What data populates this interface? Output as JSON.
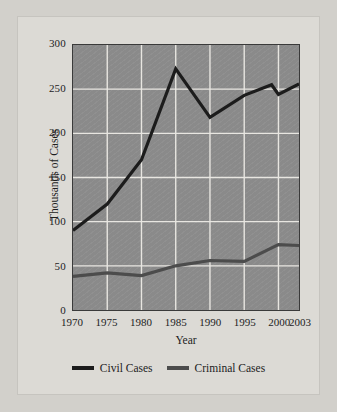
{
  "chart_data": {
    "type": "line",
    "title": "",
    "xlabel": "Year",
    "ylabel": "Thousands of Cases",
    "x": [
      1970,
      1975,
      1980,
      1985,
      1990,
      1995,
      1999,
      2000,
      2003
    ],
    "xticks": [
      "1970",
      "1975",
      "1980",
      "1985",
      "1990",
      "1995",
      "2000",
      "2003"
    ],
    "xtick_values": [
      1970,
      1975,
      1980,
      1985,
      1990,
      1995,
      2000,
      2003
    ],
    "yticks": [
      "0",
      "50",
      "100",
      "150",
      "200",
      "250",
      "300"
    ],
    "ytick_values": [
      0,
      50,
      100,
      150,
      200,
      250,
      300
    ],
    "xlim": [
      1970,
      2003
    ],
    "ylim": [
      0,
      300
    ],
    "grid": true,
    "grid_color": "#e8e6e1",
    "plot_background": "#8a8a8a",
    "legend_position": "bottom",
    "series": [
      {
        "name": "Civil Cases",
        "color": "#1c1c1c",
        "x": [
          1970,
          1975,
          1980,
          1985,
          1990,
          1995,
          1999,
          2000,
          2003
        ],
        "values": [
          90,
          120,
          170,
          273,
          218,
          243,
          255,
          244,
          256
        ]
      },
      {
        "name": "Criminal Cases",
        "color": "#4c4c4c",
        "x": [
          1970,
          1975,
          1980,
          1985,
          1990,
          1995,
          2000,
          2003
        ],
        "values": [
          38,
          42,
          39,
          50,
          56,
          55,
          74,
          73
        ]
      }
    ]
  },
  "legend": {
    "items": [
      {
        "label": "Civil Cases",
        "color": "#1c1c1c"
      },
      {
        "label": "Criminal Cases",
        "color": "#4c4c4c"
      }
    ]
  },
  "page": {
    "background": "#d2d0cb",
    "card_background": "#dcdad5"
  }
}
